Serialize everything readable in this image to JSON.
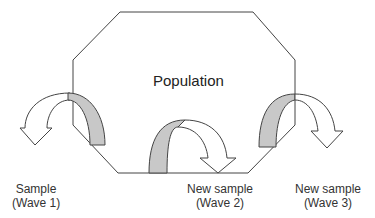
{
  "diagram": {
    "population_label": "Population",
    "samples": [
      {
        "line1": "Sample",
        "line2": "(Wave 1)"
      },
      {
        "line1": "New sample",
        "line2": "(Wave 2)"
      },
      {
        "line1": "New sample",
        "line2": "(Wave 3)"
      }
    ],
    "colors": {
      "stroke": "#444444",
      "band_fill": "#c8c8c8",
      "background": "#ffffff"
    }
  }
}
